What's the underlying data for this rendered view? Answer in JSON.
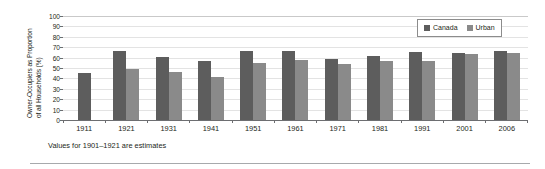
{
  "chart_data": {
    "type": "bar",
    "title": "",
    "xlabel": "",
    "ylabel_line1": "Owner-Occupiers as Proportion",
    "ylabel_line2": "of all Households (%)",
    "ylim": [
      0,
      100
    ],
    "yticks": [
      100,
      90,
      80,
      70,
      60,
      50,
      40,
      30,
      20,
      10,
      0
    ],
    "grid": true,
    "legend_position": "top-right",
    "categories": [
      "1911",
      "1921",
      "1931",
      "1941",
      "1951",
      "1961",
      "1971",
      "1981",
      "1991",
      "2001",
      "2006"
    ],
    "series": [
      {
        "name": "Canada",
        "color": "#5d5d5d",
        "values": [
          45,
          66,
          61,
          57,
          66,
          66,
          59,
          62,
          65,
          64,
          66
        ]
      },
      {
        "name": "Urban",
        "color": "#8a8a8a",
        "values": [
          null,
          49,
          46,
          41,
          55,
          58,
          54,
          57,
          57,
          63,
          64
        ]
      }
    ],
    "annotation": "Values for 1901–1921 are estimates"
  },
  "legend": {
    "entries": [
      {
        "label": "Canada"
      },
      {
        "label": "Urban"
      }
    ]
  },
  "footnote": {
    "text": "Values for 1901–1921 are estimates"
  },
  "colors": {
    "canada": "#5d5d5d",
    "urban": "#8a8a8a",
    "axis": "#6d6e71",
    "grid": "#e3e3e3",
    "text": "#231f20",
    "rule": "#a7a9ac"
  }
}
